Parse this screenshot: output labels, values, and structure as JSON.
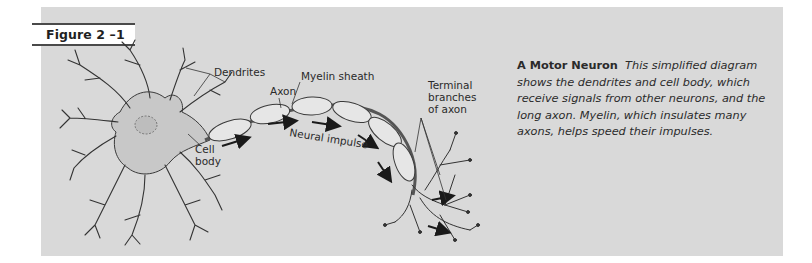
{
  "figure": {
    "label": "Figure 2 –1"
  },
  "diagram": {
    "labels": {
      "dendrites": "Dendrites",
      "myelin_sheath": "Myelin sheath",
      "axon": "Axon",
      "terminal_line1": "Terminal",
      "terminal_line2": "branches",
      "terminal_line3": "of axon",
      "cell_line1": "Cell",
      "cell_line2": "body",
      "neural_impulse": "Neural impulse"
    }
  },
  "caption": {
    "title": "A Motor Neuron",
    "body": "This simplified diagram shows the dendrites and cell body, which receive signals from other neurons, and the long axon. Myelin, which insulates many axons, helps speed their impulses."
  },
  "colors": {
    "panel": "#d9d9d9",
    "ink": "#2a2a2a",
    "rule": "#4a4a4a"
  }
}
